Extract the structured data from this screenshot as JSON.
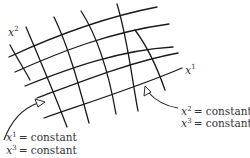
{
  "figure": {
    "type": "curvilinear-coordinate-grid",
    "axis_labels": {
      "x1": {
        "base": "x",
        "sup": "1"
      },
      "x2": {
        "base": "x",
        "sup": "2"
      }
    },
    "annotations": [
      {
        "lines": [
          {
            "base": "x",
            "sup": "1",
            "rhs": "= constant"
          },
          {
            "base": "x",
            "sup": "3",
            "rhs": "= constant"
          }
        ],
        "points_to": "x2-direction coordinate line"
      },
      {
        "lines": [
          {
            "base": "x",
            "sup": "2",
            "rhs": "= constant"
          },
          {
            "base": "x",
            "sup": "3",
            "rhs": "= constant"
          }
        ],
        "points_to": "x1-direction coordinate line"
      }
    ],
    "colors": {
      "line": "#1a1a1a",
      "text": "#333333",
      "background": "#ffffff"
    }
  }
}
